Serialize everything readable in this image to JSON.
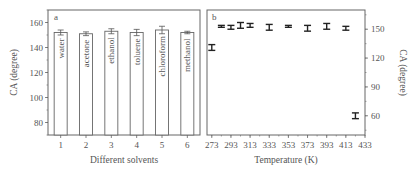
{
  "chart_data": [
    {
      "panel": "a",
      "type": "bar",
      "title": "",
      "xlabel": "Different solvents",
      "ylabel": "CA (degree)",
      "categories": [
        "1",
        "2",
        "3",
        "4",
        "5",
        "6"
      ],
      "bar_labels": [
        "water",
        "acetone",
        "ethanol",
        "toluene",
        "chloroform",
        "methanol"
      ],
      "values": [
        152,
        151,
        153,
        152,
        154,
        152
      ],
      "errors": [
        2,
        1.5,
        2,
        2.5,
        3,
        1
      ],
      "ylim": [
        70,
        170
      ],
      "yticks": [
        80,
        100,
        120,
        140,
        160
      ],
      "grid": false,
      "legend": null
    },
    {
      "panel": "b",
      "type": "scatter",
      "title": "",
      "xlabel": "Temperature (K)",
      "ylabel": "CA (degree)",
      "x": [
        273,
        283,
        293,
        303,
        313,
        333,
        353,
        373,
        393,
        413,
        423
      ],
      "values": [
        131,
        153,
        152,
        154,
        154,
        152,
        153,
        151,
        153,
        151,
        60
      ],
      "errors": [
        3,
        1,
        2,
        3,
        2,
        3,
        1,
        3,
        3,
        2,
        3
      ],
      "xticks": [
        273,
        293,
        313,
        333,
        353,
        373,
        393,
        413,
        433
      ],
      "yticks": [
        60,
        90,
        120,
        150
      ],
      "ylim": [
        40,
        170
      ],
      "xlim": [
        268,
        433
      ],
      "yaxis_position": "right",
      "grid": false,
      "legend": null
    }
  ],
  "panels": {
    "a": {
      "letter": "a",
      "xlabel": "Different solvents",
      "ylabel": "CA (degree)"
    },
    "b": {
      "letter": "b",
      "xlabel": "Temperature (K)",
      "ylabel": "CA (degree)"
    }
  }
}
